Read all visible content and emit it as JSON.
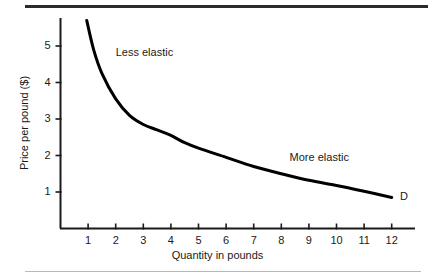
{
  "chart_data": {
    "type": "line",
    "title": "",
    "xlabel": "Quantity in pounds",
    "ylabel": "Price per pound ($)",
    "xlim": [
      0,
      12.9
    ],
    "ylim": [
      0,
      5.9
    ],
    "xticks": [
      1,
      2,
      3,
      4,
      5,
      6,
      7,
      8,
      9,
      10,
      11,
      12
    ],
    "xtick_labels": [
      "1",
      "2",
      "3",
      "4",
      "5",
      "6",
      "7",
      "8",
      "9",
      "10",
      "11",
      "12"
    ],
    "yticks": [
      1,
      2,
      3,
      4,
      5
    ],
    "ytick_labels": [
      "1",
      "2",
      "3",
      "4",
      "5"
    ],
    "grid": false,
    "legend": "none",
    "series": [
      {
        "name": "D",
        "curve_label": "D",
        "color": "#000000",
        "x": [
          0.95,
          1.2,
          1.5,
          2.0,
          2.5,
          3.0,
          3.5,
          4.0,
          4.5,
          5.0,
          6.0,
          7.0,
          8.0,
          9.0,
          10.0,
          11.0,
          12.0
        ],
        "y": [
          5.7,
          4.9,
          4.25,
          3.55,
          3.1,
          2.85,
          2.7,
          2.55,
          2.35,
          2.2,
          1.95,
          1.7,
          1.5,
          1.32,
          1.18,
          1.02,
          0.85
        ]
      }
    ],
    "annotations": [
      {
        "text": "Less elastic",
        "x": 2.0,
        "y": 4.85
      },
      {
        "text": "More elastic",
        "x": 8.3,
        "y": 1.95
      },
      {
        "text": "D",
        "x": 12.3,
        "y": 0.88
      }
    ]
  },
  "figure": {
    "top_rule_color": "#2b2b2b",
    "bottom_rule_color": "#b9b9b9",
    "background": "#ffffff",
    "axis_color": "#1a1a1a",
    "curve_color": "#000000"
  }
}
